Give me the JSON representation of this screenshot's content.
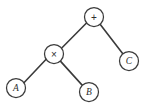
{
  "diagram": {
    "background_color": "#ffffff",
    "line_color": "#3b3b3b",
    "node_fill_color": "#ffffff",
    "text_color": "#2e2e2e",
    "width": 151,
    "height": 111
  },
  "chart_data": {
    "type": "diagram",
    "subtype": "binary-expression-tree",
    "title": "",
    "expression": "A × B + C",
    "nodes": [
      {
        "id": "root",
        "label": "+",
        "kind": "operator",
        "cx": 94,
        "cy": 17,
        "r": 9.5
      },
      {
        "id": "mul",
        "label": "×",
        "kind": "operator",
        "cx": 54,
        "cy": 54,
        "r": 9.5
      },
      {
        "id": "leafC",
        "label": "C",
        "kind": "operand",
        "cx": 129,
        "cy": 61,
        "r": 9.5
      },
      {
        "id": "leafA",
        "label": "A",
        "kind": "operand",
        "cx": 16,
        "cy": 88,
        "r": 9.5
      },
      {
        "id": "leafB",
        "label": "B",
        "kind": "operand",
        "cx": 89,
        "cy": 92,
        "r": 9.5
      }
    ],
    "edges": [
      {
        "id": "edge-root-mul",
        "from": "root",
        "to": "mul",
        "x1": 86.5,
        "y1": 23.0,
        "x2": 61.5,
        "y2": 48.2
      },
      {
        "id": "edge-root-c",
        "from": "root",
        "to": "leafC",
        "x1": 100.3,
        "y1": 24.4,
        "x2": 122.8,
        "y2": 53.8
      },
      {
        "id": "edge-mul-a",
        "from": "mul",
        "to": "leafA",
        "x1": 46.4,
        "y1": 59.0,
        "x2": 23.7,
        "y2": 83.0
      },
      {
        "id": "edge-mul-b",
        "from": "mul",
        "to": "leafB",
        "x1": 60.4,
        "y1": 61.1,
        "x2": 82.6,
        "y2": 85.6
      }
    ],
    "legend": [],
    "annotations": []
  }
}
